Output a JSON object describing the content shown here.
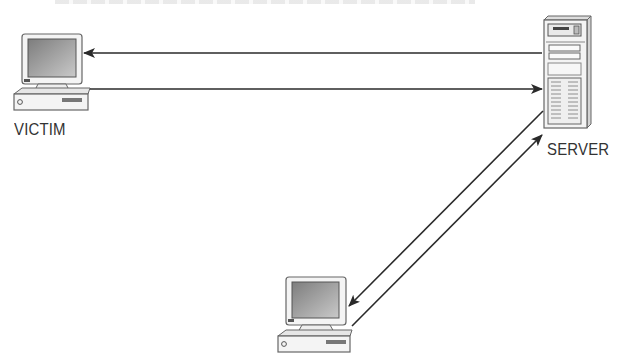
{
  "diagram": {
    "nodes": [
      {
        "id": "victim",
        "label": "VICTIM",
        "type": "desktop-computer"
      },
      {
        "id": "server",
        "label": "SERVER",
        "type": "tower-server"
      },
      {
        "id": "attacker",
        "label": "",
        "type": "desktop-computer"
      }
    ],
    "edges": [
      {
        "from": "server",
        "to": "victim",
        "direction": "left"
      },
      {
        "from": "victim",
        "to": "server",
        "direction": "right"
      },
      {
        "from": "server",
        "to": "attacker",
        "direction": "down-left"
      },
      {
        "from": "attacker",
        "to": "server",
        "direction": "up-right"
      }
    ],
    "colors": {
      "line": "#2a2a2a",
      "device_fill": "#f2f2f2",
      "screen": "#9a9a9a",
      "label": "#333333"
    }
  }
}
